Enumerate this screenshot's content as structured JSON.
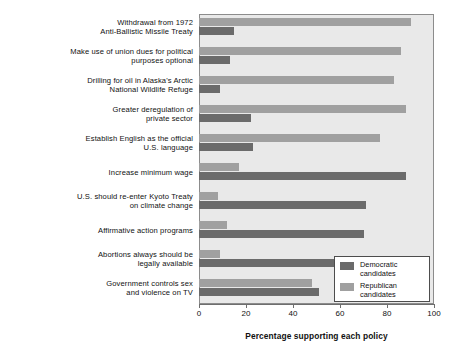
{
  "chart_data": {
    "type": "bar",
    "orientation": "horizontal",
    "title": "",
    "xlabel": "Percentage supporting each policy",
    "ylabel": "",
    "xlim": [
      0,
      100
    ],
    "xticks": [
      0,
      20,
      40,
      60,
      80,
      100
    ],
    "grid": false,
    "legend_position": "bottom-right-inside",
    "categories": [
      "Withdrawal from 1972\nAnti-Ballistic Missile Treaty",
      "Make use of union dues for political\npurposes optional",
      "Drilling for oil in Alaska's Arctic\nNational Wildlife Refuge",
      "Greater deregulation of\nprivate sector",
      "Establish English as the official\nU.S. language",
      "Increase minimum wage",
      "U.S. should re-enter Kyoto Treaty\non climate change",
      "Affirmative action programs",
      "Abortions always should be\nlegally available",
      "Government controls sex\nand violence on TV"
    ],
    "series": [
      {
        "name": "Republican candidates",
        "color": "#a0a0a0",
        "values": [
          90,
          86,
          83,
          88,
          77,
          17,
          8,
          12,
          9,
          48
        ]
      },
      {
        "name": "Democratic candidates",
        "color": "#6b6b6b",
        "values": [
          15,
          13,
          9,
          22,
          23,
          88,
          71,
          70,
          75,
          51
        ]
      }
    ]
  },
  "axis": {
    "tick_labels": [
      "0",
      "20",
      "40",
      "60",
      "80",
      "100"
    ],
    "x_title": "Percentage supporting each policy"
  },
  "legend": {
    "entries": [
      {
        "label_line1": "Democratic",
        "label_line2": "candidates",
        "color": "#6b6b6b"
      },
      {
        "label_line1": "Republican",
        "label_line2": "candidates",
        "color": "#a0a0a0"
      }
    ]
  },
  "labels": [
    {
      "line1": "Withdrawal from 1972",
      "line2": "Anti-Ballistic Missile Treaty"
    },
    {
      "line1": "Make use of union dues for political",
      "line2": "purposes optional"
    },
    {
      "line1": "Drilling for oil in Alaska's Arctic",
      "line2": "National Wildlife Refuge"
    },
    {
      "line1": "Greater deregulation of",
      "line2": "private sector"
    },
    {
      "line1": "Establish English as the official",
      "line2": "U.S. language"
    },
    {
      "line1": "Increase minimum wage",
      "line2": ""
    },
    {
      "line1": "U.S. should re-enter Kyoto Treaty",
      "line2": "on climate change"
    },
    {
      "line1": "Affirmative action programs",
      "line2": ""
    },
    {
      "line1": "Abortions always should be",
      "line2": "legally available"
    },
    {
      "line1": "Government controls sex",
      "line2": "and violence on TV"
    }
  ]
}
